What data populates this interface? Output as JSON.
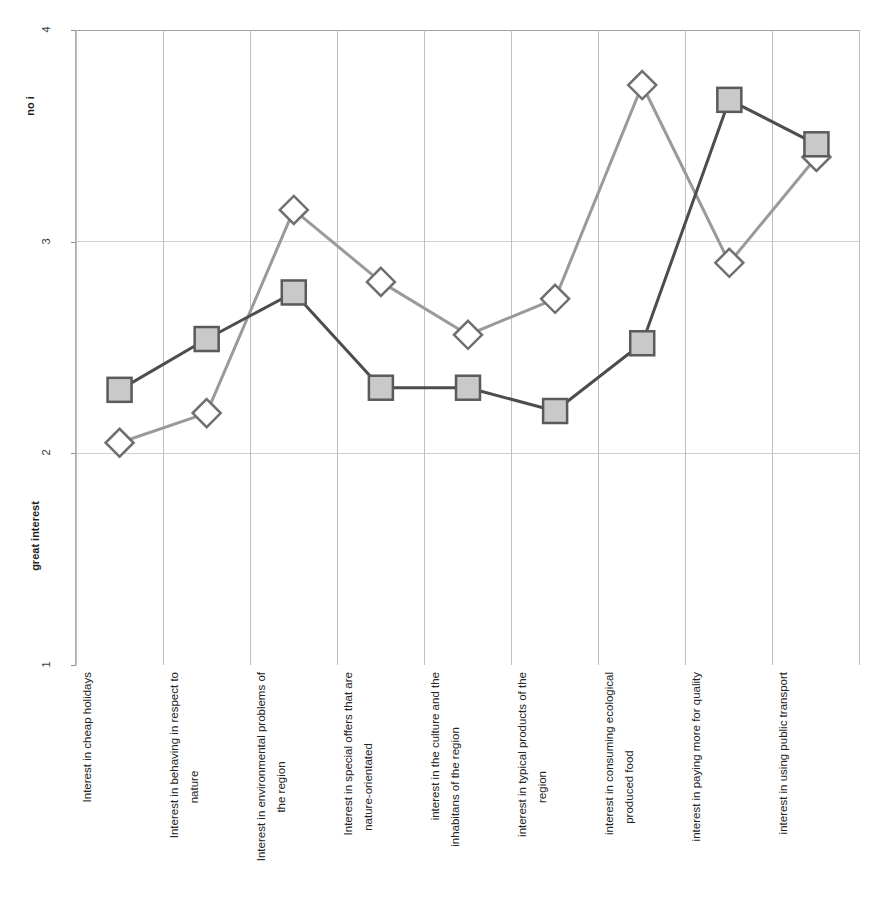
{
  "chart_data": {
    "type": "line",
    "title_remnant": "",
    "xlabel": "",
    "ylabel_top": "no i",
    "ylabel_bottom": "great interest",
    "ylim": [
      1,
      4
    ],
    "yticks": [
      1,
      2,
      3,
      4
    ],
    "ytick_labels": [
      "1",
      "2",
      "3",
      "4"
    ],
    "grid": {
      "horizontal": true,
      "vertical": true
    },
    "legend": {
      "visible": false,
      "position": "none"
    },
    "categories": [
      "Interest in cheap holidays",
      "Interest in behaving in respect to nature",
      "Interest in environmental problems of the region",
      "Interest in special offers that are nature-orientated",
      "interest in the culture and the inhabitans of the region",
      "interest in typical products of the region",
      "interest in consuming ecological produced food",
      "interest in paying more for quality",
      "interest in using public transport"
    ],
    "category_lines": [
      [
        "Interest in cheap holidays",
        ""
      ],
      [
        "Interest in behaving in respect to",
        "nature"
      ],
      [
        "Interest in environmental problems of",
        "the region"
      ],
      [
        "Interest in special offers that are",
        "nature-orientated"
      ],
      [
        "interest in the culture and the",
        "inhabitans of the region"
      ],
      [
        "interest in typical products of the",
        "region"
      ],
      [
        "interest in consuming ecological",
        "produced food"
      ],
      [
        "interest in paying more for quality",
        ""
      ],
      [
        "interest in using public transport",
        ""
      ]
    ],
    "series": [
      {
        "name": "square-series",
        "marker": "square",
        "line_color": "#4d4d4d",
        "marker_fill": "#c9c9c9",
        "marker_edge": "#5a5a5a",
        "values": [
          2.3,
          2.54,
          2.76,
          2.31,
          2.31,
          2.2,
          2.52,
          3.67,
          3.46
        ]
      },
      {
        "name": "diamond-series",
        "marker": "diamond",
        "line_color": "#9a9a9a",
        "marker_fill": "#ffffff",
        "marker_edge": "#6f6f6f",
        "values": [
          2.05,
          2.19,
          3.15,
          2.81,
          2.56,
          2.73,
          3.74,
          2.9,
          3.4
        ]
      }
    ]
  }
}
